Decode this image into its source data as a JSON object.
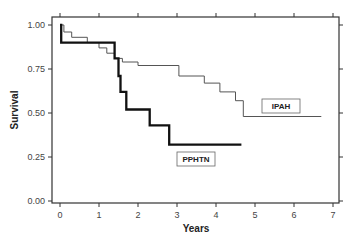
{
  "chart_data": {
    "type": "line",
    "subtype": "kaplan-meier-step",
    "title": "",
    "xlabel": "Years",
    "ylabel": "Survival",
    "xlim": [
      0,
      7
    ],
    "ylim": [
      0,
      1.0
    ],
    "x_ticks": [
      "0",
      "1",
      "2",
      "3",
      "4",
      "5",
      "6",
      "7"
    ],
    "y_ticks": [
      "0.00",
      "0.25",
      "0.50",
      "0.75",
      "1.00"
    ],
    "grid": false,
    "legend_position": "inline-labels",
    "series": [
      {
        "name": "PPHTN",
        "style": "thick-black",
        "points": [
          [
            0,
            1.0
          ],
          [
            0.03,
            1.0
          ],
          [
            0.03,
            0.9
          ],
          [
            1.4,
            0.9
          ],
          [
            1.4,
            0.81
          ],
          [
            1.5,
            0.81
          ],
          [
            1.5,
            0.71
          ],
          [
            1.55,
            0.71
          ],
          [
            1.55,
            0.62
          ],
          [
            1.7,
            0.62
          ],
          [
            1.7,
            0.52
          ],
          [
            2.3,
            0.52
          ],
          [
            2.3,
            0.43
          ],
          [
            2.8,
            0.43
          ],
          [
            2.8,
            0.32
          ],
          [
            4.65,
            0.32
          ]
        ]
      },
      {
        "name": "IPAH",
        "style": "thin-gray",
        "points": [
          [
            0,
            1.0
          ],
          [
            0.1,
            1.0
          ],
          [
            0.1,
            0.96
          ],
          [
            0.3,
            0.96
          ],
          [
            0.3,
            0.93
          ],
          [
            0.7,
            0.93
          ],
          [
            0.7,
            0.9
          ],
          [
            1.0,
            0.9
          ],
          [
            1.0,
            0.87
          ],
          [
            1.2,
            0.87
          ],
          [
            1.2,
            0.84
          ],
          [
            1.4,
            0.84
          ],
          [
            1.4,
            0.81
          ],
          [
            1.6,
            0.81
          ],
          [
            1.6,
            0.79
          ],
          [
            2.0,
            0.79
          ],
          [
            2.0,
            0.77
          ],
          [
            3.05,
            0.77
          ],
          [
            3.05,
            0.71
          ],
          [
            3.7,
            0.71
          ],
          [
            3.7,
            0.67
          ],
          [
            4.1,
            0.67
          ],
          [
            4.1,
            0.62
          ],
          [
            4.5,
            0.62
          ],
          [
            4.5,
            0.57
          ],
          [
            4.7,
            0.57
          ],
          [
            4.7,
            0.48
          ],
          [
            6.7,
            0.48
          ]
        ]
      }
    ],
    "annotations": [
      {
        "text": "IPAH",
        "x": 5.8,
        "y": 0.57
      },
      {
        "text": "PPHTN",
        "x": 3.3,
        "y": 0.25
      }
    ]
  },
  "labels": {
    "ipah": "IPAH",
    "pphtn": "PPHTN",
    "xlabel": "Years",
    "ylabel": "Survival"
  }
}
